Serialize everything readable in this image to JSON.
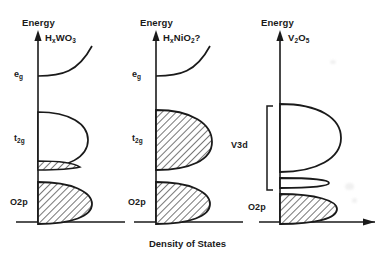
{
  "figure": {
    "axis_title": "Density of States",
    "energy_label": "Energy",
    "line_color": "#1a1a1a",
    "fill_hatch_color": "#555555",
    "background": "#ffffff"
  },
  "panels": [
    {
      "id": "hxwo3",
      "formula": "HₓWO₃",
      "energy_label": "Energy",
      "band_labels": [
        {
          "key": "eg",
          "text": "e",
          "sub": "g"
        },
        {
          "key": "t2g",
          "text": "t",
          "sub": "2g"
        },
        {
          "key": "o2p",
          "text": "O2p",
          "sub": ""
        }
      ],
      "bands": [
        {
          "name": "eg",
          "fill": "none",
          "note": "empty e_g band, upper"
        },
        {
          "name": "t2g",
          "fill": "partial",
          "note": "t_2g band, thin filled sliver at bottom"
        },
        {
          "name": "o2p",
          "fill": "full",
          "note": "O2p valence band fully occupied"
        }
      ]
    },
    {
      "id": "hxnio2",
      "formula": "HₓNiO₂?",
      "energy_label": "Energy",
      "band_labels": [
        {
          "key": "eg",
          "text": "e",
          "sub": "g"
        },
        {
          "key": "t2g",
          "text": "t",
          "sub": "2g"
        },
        {
          "key": "o2p",
          "text": "O2p",
          "sub": ""
        }
      ],
      "bands": [
        {
          "name": "eg",
          "fill": "none",
          "note": "empty e_g band, upper"
        },
        {
          "name": "t2g",
          "fill": "full",
          "note": "t_2g band fully occupied"
        },
        {
          "name": "o2p",
          "fill": "full",
          "note": "O2p valence band fully occupied"
        }
      ]
    },
    {
      "id": "v2o5",
      "formula": "V₂O₅",
      "energy_label": "Energy",
      "band_labels": [
        {
          "key": "v3d",
          "text": "V3d",
          "sub": ""
        },
        {
          "key": "o2p",
          "text": "O2p",
          "sub": ""
        }
      ],
      "bracket": {
        "label": "V3d",
        "spans": [
          "upper empty d band",
          "narrow split-off d band"
        ]
      },
      "bands": [
        {
          "name": "v3d_upper",
          "fill": "none",
          "note": "large empty V3d band"
        },
        {
          "name": "v3d_narrow",
          "fill": "none",
          "note": "narrow empty split-off V3d band"
        },
        {
          "name": "o2p",
          "fill": "full",
          "note": "O2p valence band fully occupied"
        }
      ]
    }
  ]
}
